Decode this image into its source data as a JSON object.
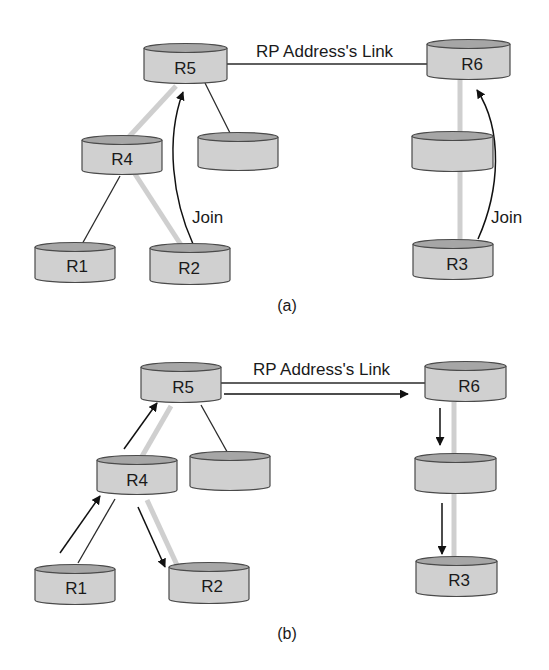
{
  "figure": {
    "panels": [
      {
        "id": "a",
        "caption": "(a)",
        "link_label": "RP Address's Link",
        "join_labels": [
          "Join",
          "Join"
        ],
        "nodes": {
          "R5": "R5",
          "R6": "R6",
          "R4": "R4",
          "R1": "R1",
          "R2": "R2",
          "R3": "R3",
          "unnamed_left": "",
          "unnamed_right": ""
        }
      },
      {
        "id": "b",
        "caption": "(b)",
        "link_label": "RP Address's Link",
        "nodes": {
          "R5": "R5",
          "R6": "R6",
          "R4": "R4",
          "R1": "R1",
          "R2": "R2",
          "R3": "R3",
          "unnamed_left": "",
          "unnamed_right": ""
        }
      }
    ],
    "colors": {
      "cylinder_body": "#d0d0d0",
      "cylinder_top": "#a6a6a6",
      "tree_branch": "#cfcfcf",
      "link_line": "#2a2a2a"
    }
  }
}
